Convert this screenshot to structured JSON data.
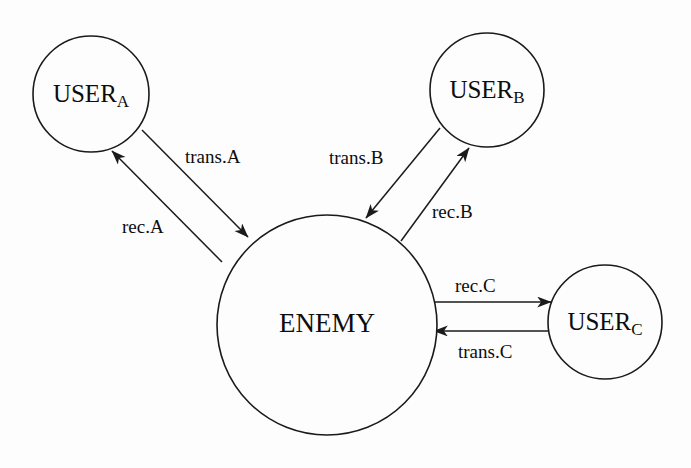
{
  "figure": {
    "type": "node-link-diagram",
    "background_color": "#fdfdfd",
    "stroke_color": "#1a1a1a",
    "text_color": "#0d0d0d"
  },
  "nodes": [
    {
      "id": "user_a",
      "label_main": "USER",
      "label_sub": "A",
      "cx": 91,
      "cy": 94,
      "r": 58
    },
    {
      "id": "user_b",
      "label_main": "USER",
      "label_sub": "B",
      "cx": 487,
      "cy": 90,
      "r": 57
    },
    {
      "id": "user_c",
      "label_main": "USER",
      "label_sub": "C",
      "cx": 605,
      "cy": 322,
      "r": 57
    },
    {
      "id": "enemy",
      "label_main": "ENEMY",
      "label_sub": "",
      "cx": 327,
      "cy": 325,
      "r": 110
    }
  ],
  "edges": [
    {
      "id": "trans_a",
      "label": "trans.A",
      "from": "user_a",
      "to": "enemy",
      "label_x": 185,
      "label_y": 163
    },
    {
      "id": "rec_a",
      "label": "rec.A",
      "from": "enemy",
      "to": "user_a",
      "label_x": 122,
      "label_y": 233
    },
    {
      "id": "trans_b",
      "label": "trans.B",
      "from": "user_b",
      "to": "enemy",
      "label_x": 329,
      "label_y": 164
    },
    {
      "id": "rec_b",
      "label": "rec.B",
      "from": "enemy",
      "to": "user_b",
      "label_x": 432,
      "label_y": 218
    },
    {
      "id": "rec_c",
      "label": "rec.C",
      "from": "enemy",
      "to": "user_c",
      "label_x": 455,
      "label_y": 292
    },
    {
      "id": "trans_c",
      "label": "trans.C",
      "from": "user_c",
      "to": "enemy",
      "label_x": 458,
      "label_y": 358
    }
  ]
}
